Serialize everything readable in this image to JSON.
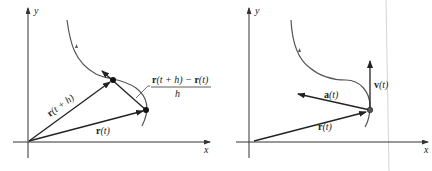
{
  "figures": [
    {
      "id": "left",
      "axes": {
        "x_label": "x",
        "y_label": "y"
      },
      "vectors": [
        {
          "name": "r(t+h)",
          "label_bold": "r",
          "label_rest": "(t + h)"
        },
        {
          "name": "r(t)",
          "label_bold": "r",
          "label_rest": "(t)"
        }
      ],
      "secant_label": {
        "numerator_a_bold": "r",
        "numerator_a_rest": "(t + h) − ",
        "numerator_b_bold": "r",
        "numerator_b_rest": "(t)",
        "denominator": "h"
      }
    },
    {
      "id": "right",
      "axes": {
        "x_label": "x",
        "y_label": "y"
      },
      "vectors": [
        {
          "name": "r(t)",
          "label_bold": "r",
          "label_rest": "(t)"
        },
        {
          "name": "a(t)",
          "label_bold": "a",
          "label_rest": "(t)"
        },
        {
          "name": "v(t)",
          "label_bold": "v",
          "label_rest": "(t)"
        }
      ]
    }
  ],
  "colors": {
    "curve": "#555555",
    "vector": "#222222",
    "axis": "#333333",
    "fold_line": "#cfcfcf"
  }
}
